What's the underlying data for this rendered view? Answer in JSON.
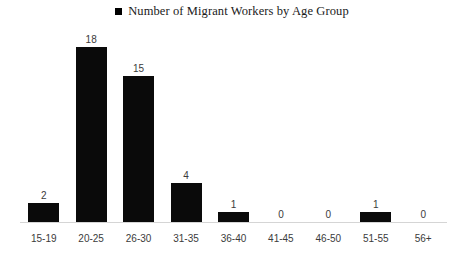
{
  "chart_data": {
    "type": "bar",
    "title": "Number of Migrant Workers by Age Group",
    "xlabel": "",
    "ylabel": "",
    "categories": [
      "15-19",
      "20-25",
      "26-30",
      "31-35",
      "36-40",
      "41-45",
      "46-50",
      "51-55",
      "56+"
    ],
    "values": [
      2,
      18,
      15,
      4,
      1,
      0,
      0,
      1,
      0
    ],
    "data_labels": [
      "2",
      "18",
      "15",
      "4",
      "1",
      "0",
      "0",
      "1",
      "0"
    ],
    "ylim": [
      0,
      18
    ],
    "grid": false,
    "axis_visible": {
      "x": true,
      "y": false
    },
    "legend": {
      "position": "top-center",
      "entries": [
        {
          "label": "Number of Migrant Workers by Age Group",
          "marker": "square",
          "color": "#000000"
        }
      ]
    },
    "colors": {
      "bar": "#0a0a0a",
      "axis": "#d5d5d5",
      "label_text": "#3b3b3b",
      "title_text": "#1a1a1a",
      "background": "#ffffff"
    }
  }
}
